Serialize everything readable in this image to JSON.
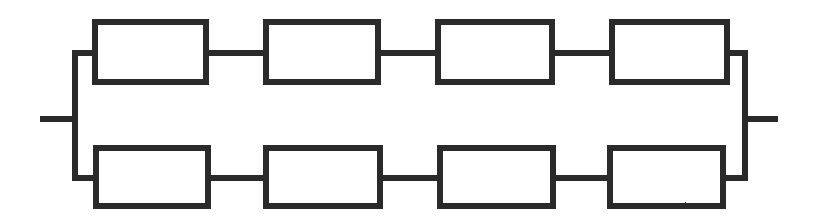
{
  "diagram": {
    "type": "electrical-schematic",
    "style": {
      "line_color": "#2b2b2b",
      "fill_color": "#ffffff",
      "background_color": "#ffffff",
      "stroke_width": 6,
      "rendering": "scanned-bitmap"
    },
    "canvas": {
      "width": 813,
      "height": 222
    },
    "branches": [
      {
        "name": "top-branch",
        "rail_y": 53,
        "components": [
          {
            "label": "",
            "x": 95,
            "y": 22,
            "width": 111,
            "height": 60
          },
          {
            "label": "",
            "x": 266,
            "y": 22,
            "width": 112,
            "height": 60
          },
          {
            "label": "",
            "x": 438,
            "y": 22,
            "width": 114,
            "height": 60
          },
          {
            "label": "",
            "x": 612,
            "y": 22,
            "width": 115,
            "height": 60
          }
        ],
        "connectors": [
          {
            "x1": 206,
            "x2": 266,
            "y": 53
          },
          {
            "x1": 378,
            "x2": 438,
            "y": 53
          },
          {
            "x1": 552,
            "x2": 612,
            "y": 53
          }
        ],
        "bus_stubs": [
          {
            "x1": 75,
            "x2": 95,
            "y": 53
          },
          {
            "x1": 727,
            "x2": 745,
            "y": 53
          }
        ]
      },
      {
        "name": "bottom-branch",
        "rail_y": 178,
        "components": [
          {
            "label": "",
            "x": 96,
            "y": 148,
            "width": 112,
            "height": 58
          },
          {
            "label": "",
            "x": 266,
            "y": 148,
            "width": 114,
            "height": 58
          },
          {
            "label": "",
            "x": 440,
            "y": 148,
            "width": 113,
            "height": 58
          },
          {
            "label": "",
            "x": 610,
            "y": 148,
            "width": 113,
            "height": 58
          }
        ],
        "connectors": [
          {
            "x1": 208,
            "x2": 266,
            "y": 178
          },
          {
            "x1": 380,
            "x2": 440,
            "y": 178
          },
          {
            "x1": 553,
            "x2": 610,
            "y": 178
          }
        ],
        "bus_stubs": [
          {
            "x1": 75,
            "x2": 96,
            "y": 178
          },
          {
            "x1": 723,
            "x2": 745,
            "y": 178
          }
        ]
      }
    ],
    "bus_bars": [
      {
        "name": "left-bus-bar",
        "x": 75,
        "y1": 53,
        "y2": 178
      },
      {
        "name": "right-bus-bar",
        "x": 745,
        "y1": 53,
        "y2": 178
      }
    ],
    "terminals": [
      {
        "name": "left-terminal-lead",
        "x1": 40,
        "x2": 75,
        "y": 119
      },
      {
        "name": "right-terminal-lead",
        "x1": 745,
        "x2": 778,
        "y": 119
      }
    ]
  }
}
